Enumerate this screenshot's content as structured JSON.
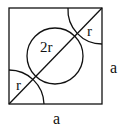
{
  "diagram": {
    "labels": {
      "inner_circle": "2r",
      "top_right_quarter": "r",
      "bottom_left_quarter": "r",
      "side_right": "a",
      "side_bottom": "a"
    },
    "colors": {
      "stroke": "#111111",
      "background": "#ffffff"
    }
  }
}
